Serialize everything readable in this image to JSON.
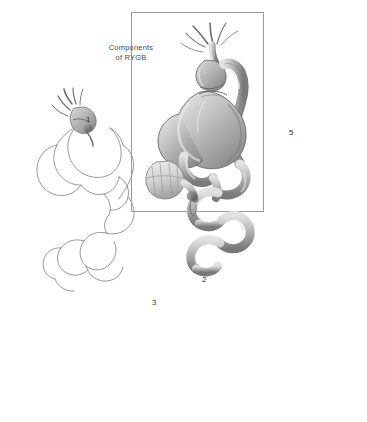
{
  "figure": {
    "background_color": "#ffffff",
    "title_caption": "Components\nof RYGB",
    "frame": {
      "border_color": "#9a9a9a",
      "x": 131,
      "y": 12,
      "width": 131,
      "height": 198
    },
    "palette": {
      "outline": "#6e6e6e",
      "outline_light": "#8d8d8d",
      "shade_light": "#d6d6d6",
      "shade_mid": "#b2b2b2",
      "shade_dark": "#8a8a8a",
      "shade_darkest": "#5e5e5e",
      "staple_line": "#7a7a7a",
      "text": "#2e2e2e"
    },
    "panels": [
      {
        "id": "panel-main",
        "name": "components-of-rygb",
        "label": "",
        "caption": "Components\nof RYGB",
        "framed": true,
        "style": "fully-shaded",
        "description": "Complete Roux-en-Y gastric bypass anatomy with gastric pouch, bypassed stomach remnant, Roux limb, biliopancreatic limb, jejunojejunostomy and duodenal stump"
      },
      {
        "id": "panel-1",
        "name": "gastric-pouch-and-gastrojejunostomy",
        "label": "1",
        "label_x": 86,
        "label_y": 115,
        "framed": false,
        "style": "outline-with-shaded-component",
        "description": "Line drawing of stomach and small bowel with the small gastric pouch and gastrojejunal anastomosis shaded"
      },
      {
        "id": "panel-2",
        "name": "bypassed-stomach-remnant",
        "label": "2",
        "label_x": 202,
        "label_y": 275,
        "framed": false,
        "style": "outline-with-shaded-component",
        "description": "Line drawing with the bypassed gastric remnant shaded"
      },
      {
        "id": "panel-3",
        "name": "biliopancreatic-limb",
        "label": "3",
        "label_x": 152,
        "label_y": 303,
        "framed": false,
        "style": "outline-with-shaded-component",
        "description": "Line drawing with the biliopancreatic (afferent) limb shaded"
      },
      {
        "id": "panel-5",
        "name": "roux-limb",
        "label": "5",
        "label_x": 289,
        "label_y": 131,
        "framed": false,
        "style": "outline-with-shaded-component",
        "description": "Line drawing with the Roux (alimentary) limb shaded running down the right side"
      }
    ]
  }
}
